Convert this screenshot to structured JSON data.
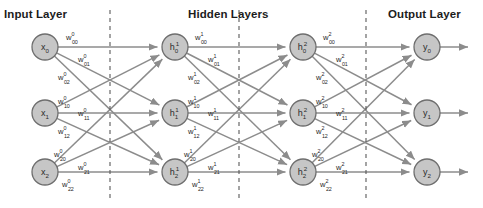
{
  "figure": {
    "title_labels": [
      {
        "text": "Input Layer",
        "x": 4,
        "y": 8
      },
      {
        "text": "Hidden Layers",
        "x": 188,
        "y": 8
      },
      {
        "text": "Output Layer",
        "x": 388,
        "y": 8
      }
    ],
    "colors": {
      "node_fill": "#c6c6c6",
      "node_stroke": "#6e6e6e",
      "edge": "#8c8c8c",
      "dash": "#5a5a5a",
      "text": "#1c1c1c"
    },
    "separators": [
      {
        "name": "separator-input-hidden",
        "x": 110
      },
      {
        "name": "separator-hidden1-hidden2",
        "x": 239
      },
      {
        "name": "separator-hidden2-output",
        "x": 366
      }
    ],
    "node_radius": 13,
    "columns": [
      {
        "name": "input-layer",
        "x": 45,
        "nodes": [
          {
            "base": "x",
            "sub": "0",
            "sup": "",
            "y": 47
          },
          {
            "base": "x",
            "sub": "1",
            "sup": "",
            "y": 113
          },
          {
            "base": "x",
            "sub": "2",
            "sup": "",
            "y": 172
          }
        ]
      },
      {
        "name": "hidden-layer-1",
        "x": 175,
        "nodes": [
          {
            "base": "h",
            "sub": "0",
            "sup": "1",
            "y": 47
          },
          {
            "base": "h",
            "sub": "1",
            "sup": "1",
            "y": 113
          },
          {
            "base": "h",
            "sub": "2",
            "sup": "1",
            "y": 172
          }
        ]
      },
      {
        "name": "hidden-layer-2",
        "x": 303,
        "nodes": [
          {
            "base": "h",
            "sub": "0",
            "sup": "2",
            "y": 47
          },
          {
            "base": "h",
            "sub": "1",
            "sup": "2",
            "y": 113
          },
          {
            "base": "h",
            "sub": "2",
            "sup": "2",
            "y": 172
          }
        ]
      },
      {
        "name": "output-layer",
        "x": 427,
        "nodes": [
          {
            "base": "y",
            "sub": "0",
            "sup": "",
            "y": 47
          },
          {
            "base": "y",
            "sub": "1",
            "sup": "",
            "y": 113
          },
          {
            "base": "y",
            "sub": "2",
            "sup": "",
            "y": 172
          }
        ]
      }
    ],
    "output_arrows": [
      {
        "y": 47,
        "x1": 440,
        "x2": 468
      },
      {
        "y": 113,
        "x1": 440,
        "x2": 468
      },
      {
        "y": 172,
        "x1": 440,
        "x2": 468
      }
    ],
    "weight_groups": [
      {
        "name": "weights-layer-0",
        "superscript": "0",
        "labels": [
          {
            "base": "w",
            "sub": "00",
            "sup": "0",
            "x": 66,
            "y": 40
          },
          {
            "base": "w",
            "sub": "01",
            "sup": "0",
            "x": 78,
            "y": 62
          },
          {
            "base": "w",
            "sub": "02",
            "sup": "0",
            "x": 58,
            "y": 80
          },
          {
            "base": "w",
            "sub": "10",
            "sup": "0",
            "x": 58,
            "y": 104
          },
          {
            "base": "w",
            "sub": "11",
            "sup": "0",
            "x": 78,
            "y": 116
          },
          {
            "base": "w",
            "sub": "12",
            "sup": "0",
            "x": 58,
            "y": 134
          },
          {
            "base": "w",
            "sub": "20",
            "sup": "0",
            "x": 54,
            "y": 157
          },
          {
            "base": "w",
            "sub": "21",
            "sup": "0",
            "x": 78,
            "y": 170
          },
          {
            "base": "w",
            "sub": "22",
            "sup": "0",
            "x": 62,
            "y": 187
          }
        ]
      },
      {
        "name": "weights-layer-1",
        "superscript": "1",
        "labels": [
          {
            "base": "w",
            "sub": "00",
            "sup": "1",
            "x": 195,
            "y": 40
          },
          {
            "base": "w",
            "sub": "01",
            "sup": "1",
            "x": 208,
            "y": 62
          },
          {
            "base": "w",
            "sub": "02",
            "sup": "1",
            "x": 188,
            "y": 80
          },
          {
            "base": "w",
            "sub": "10",
            "sup": "1",
            "x": 188,
            "y": 104
          },
          {
            "base": "w",
            "sub": "11",
            "sup": "1",
            "x": 208,
            "y": 116
          },
          {
            "base": "w",
            "sub": "12",
            "sup": "1",
            "x": 188,
            "y": 134
          },
          {
            "base": "w",
            "sub": "20",
            "sup": "1",
            "x": 184,
            "y": 157
          },
          {
            "base": "w",
            "sub": "21",
            "sup": "1",
            "x": 208,
            "y": 170
          },
          {
            "base": "w",
            "sub": "22",
            "sup": "1",
            "x": 192,
            "y": 187
          }
        ]
      },
      {
        "name": "weights-layer-2",
        "superscript": "2",
        "labels": [
          {
            "base": "w",
            "sub": "00",
            "sup": "2",
            "x": 323,
            "y": 40
          },
          {
            "base": "w",
            "sub": "01",
            "sup": "2",
            "x": 336,
            "y": 62
          },
          {
            "base": "w",
            "sub": "02",
            "sup": "2",
            "x": 316,
            "y": 80
          },
          {
            "base": "w",
            "sub": "10",
            "sup": "2",
            "x": 316,
            "y": 104
          },
          {
            "base": "w",
            "sub": "11",
            "sup": "2",
            "x": 336,
            "y": 116
          },
          {
            "base": "w",
            "sub": "12",
            "sup": "2",
            "x": 316,
            "y": 134
          },
          {
            "base": "w",
            "sub": "20",
            "sup": "2",
            "x": 312,
            "y": 157
          },
          {
            "base": "w",
            "sub": "21",
            "sup": "2",
            "x": 336,
            "y": 170
          },
          {
            "base": "w",
            "sub": "22",
            "sup": "2",
            "x": 320,
            "y": 187
          }
        ]
      }
    ]
  }
}
